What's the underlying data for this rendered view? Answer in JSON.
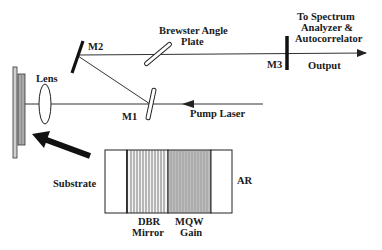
{
  "diagram": {
    "type": "optical-setup",
    "labels": {
      "m1": "M1",
      "m2": "M2",
      "m3": "M3",
      "lens": "Lens",
      "brewster_line1": "Brewster Angle",
      "brewster_line2": "Plate",
      "dest_line1": "To Spectrum",
      "dest_line2": "Analyzer &",
      "dest_line3": "Autocorrelator",
      "output": "Output",
      "pump": "Pump Laser",
      "substrate": "Substrate",
      "dbr_line1": "DBR",
      "dbr_line2": "Mirror",
      "mqw_line1": "MQW",
      "mqw_line2": "Gain",
      "ar": "AR"
    },
    "colors": {
      "line": "#222222",
      "dbr_fill": "#f4f4f4",
      "mqw_fill": "#bdbdbd",
      "device_outer": "#cfcfcf",
      "device_inner": "#a9a9a9"
    },
    "device_layers": [
      "Substrate",
      "DBR Mirror",
      "MQW Gain",
      "AR"
    ]
  }
}
